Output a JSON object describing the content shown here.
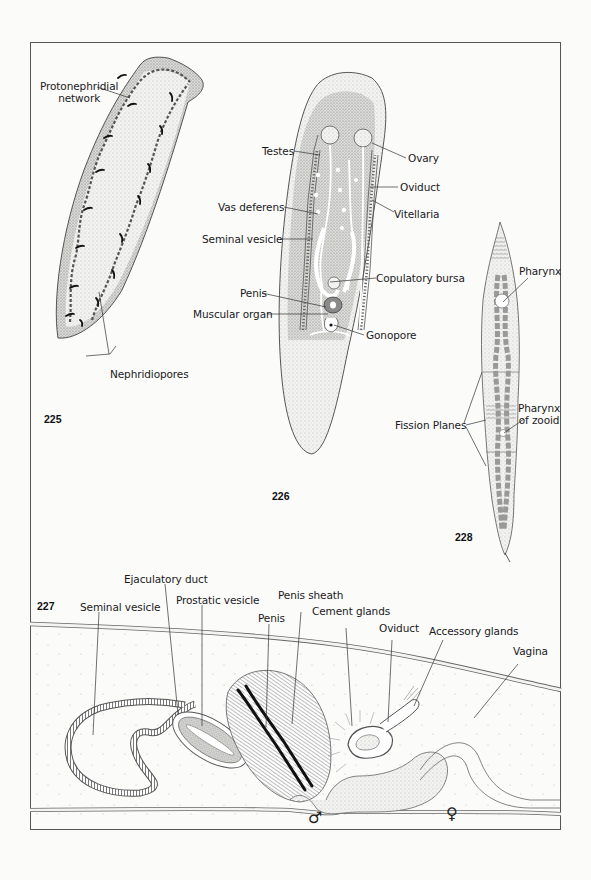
{
  "plate": {
    "frame_color": "#555555",
    "background": "#fbfbfa"
  },
  "figures": [
    {
      "number": "225",
      "subject": "flatworm-excretory-system",
      "labels": {
        "protonephridial_network": "Protonephridial network",
        "protonephridial_line1": "Protonephridial",
        "protonephridial_line2": "network",
        "nephridiopores": "Nephridiopores"
      }
    },
    {
      "number": "226",
      "subject": "flatworm-reproductive-system",
      "labels": {
        "testes": "Testes",
        "vas_deferens": "Vas deferens",
        "seminal_vesicle": "Seminal vesicle",
        "penis": "Penis",
        "muscular_organ": "Muscular organ",
        "ovary": "Ovary",
        "oviduct": "Oviduct",
        "vitellaria": "Vitellaria",
        "copulatory_bursa": "Copulatory bursa",
        "gonopore": "Gonopore"
      }
    },
    {
      "number": "227",
      "subject": "copulatory-apparatus-section",
      "labels": {
        "seminal_vesicle": "Seminal vesicle",
        "ejaculatory_duct": "Ejaculatory duct",
        "prostatic_vesicle": "Prostatic vesicle",
        "penis": "Penis",
        "penis_sheath": "Penis sheath",
        "cement_glands": "Cement glands",
        "oviduct": "Oviduct",
        "accessory_glands": "Accessory glands",
        "vagina": "Vagina"
      },
      "symbols": {
        "male": "♂",
        "female": "♀"
      }
    },
    {
      "number": "228",
      "subject": "asexual-fission-worm",
      "labels": {
        "pharynx": "Pharynx",
        "fission_planes": "Fission Planes",
        "pharynx_of_zooid_line1": "Pharynx",
        "pharynx_of_zooid_line2": "of zooid"
      }
    }
  ]
}
